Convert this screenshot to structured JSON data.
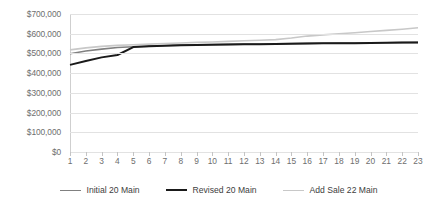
{
  "chart_data": {
    "type": "line",
    "title": "",
    "xlabel": "",
    "ylabel": "",
    "categories": [
      "1",
      "2",
      "3",
      "4",
      "5",
      "6",
      "7",
      "8",
      "9",
      "10",
      "11",
      "12",
      "13",
      "14",
      "15",
      "16",
      "17",
      "18",
      "19",
      "20",
      "21",
      "22",
      "23"
    ],
    "ylim": [
      0,
      700000
    ],
    "ytick_labels": [
      "$700,000",
      "$600,000",
      "$500,000",
      "$400,000",
      "$300,000",
      "$200,000",
      "$100,000",
      "$0"
    ],
    "ytick_values": [
      700000,
      600000,
      500000,
      400000,
      300000,
      200000,
      100000,
      0
    ],
    "ytick_step": 100000,
    "grid": true,
    "legend_position": "bottom",
    "series": [
      {
        "name": "Initial 20 Main",
        "color": "#808080",
        "width": 1.6,
        "values": [
          498000,
          512000,
          522000,
          530000,
          534000,
          537000,
          540000,
          542000,
          544000,
          545000,
          546000,
          547000,
          548000,
          549000,
          550000,
          551000,
          552000,
          553000,
          553000,
          554000,
          554000,
          555000,
          556000
        ]
      },
      {
        "name": "Revised 20 Main",
        "color": "#1a1a1a",
        "width": 2.0,
        "values": [
          442000,
          462000,
          480000,
          492000,
          532000,
          536000,
          539000,
          541000,
          543000,
          544000,
          545000,
          546000,
          547000,
          548000,
          549000,
          550000,
          551000,
          552000,
          552000,
          553000,
          554000,
          555000,
          556000
        ]
      },
      {
        "name": "Add Sale 22 Main",
        "color": "#c8c8c8",
        "width": 1.6,
        "values": [
          518000,
          528000,
          536000,
          541000,
          544000,
          547000,
          550000,
          553000,
          556000,
          558000,
          561000,
          564000,
          567000,
          570000,
          578000,
          588000,
          594000,
          600000,
          605000,
          611000,
          617000,
          623000,
          630000
        ]
      }
    ]
  }
}
